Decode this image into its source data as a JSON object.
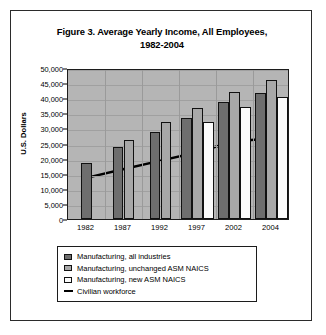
{
  "figure": {
    "title_line1": "Figure 3. Average Yearly Income, All Employees,",
    "title_line2": "1982-2004",
    "border_color": "#2b2b2b",
    "plot_background": "#b5b5b5"
  },
  "legend": {
    "entries": [
      {
        "label": "Manufacturing, all industries",
        "swatch": "dark-gray-square",
        "color": "#6e6e6e"
      },
      {
        "label": "Manufacturing, unchanged ASM NAICS",
        "swatch": "medium-gray-square",
        "color": "#a8a8a8"
      },
      {
        "label": "Manufacturing, new ASM NAICS",
        "swatch": "white-square",
        "color": "#fbfbfb"
      },
      {
        "label": "Civilian workforce",
        "swatch": "black-line",
        "color": "#000000"
      }
    ]
  },
  "chart_data": {
    "type": "bar",
    "title": "Figure 3. Average Yearly Income, All Employees, 1982-2004",
    "xlabel": "",
    "ylabel": "U.S. Dollars",
    "categories": [
      "1982",
      "1987",
      "1992",
      "1997",
      "2002",
      "2004"
    ],
    "ylim": [
      0,
      50000
    ],
    "ytick_step": 5000,
    "ytick_labels": [
      "0",
      "5,000",
      "10,000",
      "15,000",
      "20,000",
      "25,000",
      "30,000",
      "35,000",
      "40,000",
      "45,000",
      "50,000"
    ],
    "grid": true,
    "legend_position": "below-plot",
    "series": [
      {
        "name": "Manufacturing, all industries",
        "type": "bar",
        "color": "#6e6e6e",
        "values": [
          18700,
          23800,
          28700,
          33400,
          38600,
          41800
        ]
      },
      {
        "name": "Manufacturing, unchanged ASM NAICS",
        "type": "bar",
        "color": "#a8a8a8",
        "values": [
          null,
          26200,
          32000,
          36600,
          42100,
          45900
        ]
      },
      {
        "name": "Manufacturing, new ASM NAICS",
        "type": "bar",
        "color": "#fbfbfb",
        "values": [
          null,
          null,
          null,
          32000,
          37100,
          40300
        ]
      },
      {
        "name": "Civilian workforce",
        "type": "line",
        "color": "#000000",
        "values": [
          13800,
          16700,
          19500,
          22300,
          26000,
          27000
        ]
      }
    ]
  }
}
